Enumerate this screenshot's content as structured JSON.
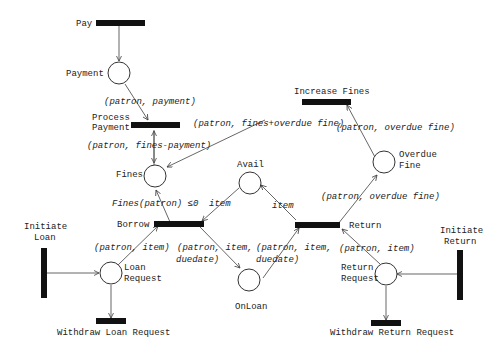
{
  "places": {
    "payment": "Payment",
    "fines": "Fines",
    "avail": "Avail",
    "overdue_fine_1": "Overdue",
    "overdue_fine_2": "Fine",
    "loan_request_1": "Loan",
    "loan_request_2": "Request",
    "onloan": "OnLoan",
    "return_request_1": "Return",
    "return_request_2": "Request"
  },
  "transitions": {
    "pay": "Pay",
    "process_payment_1": "Process",
    "process_payment_2": "Payment",
    "increase_fines": "Increase Fines",
    "borrow": "Borrow",
    "return": "Return",
    "initiate_loan_1": "Initiate",
    "initiate_loan_2": "Loan",
    "initiate_return_1": "Initiate",
    "initiate_return_2": "Return",
    "withdraw_loan": "Withdraw Loan Request",
    "withdraw_return": "Withdraw Return Request"
  },
  "arc_labels": {
    "patron_payment": "(patron, payment)",
    "patron_fines_minus_payment": "(patron, fines-payment)",
    "patron_fines_plus_overdue": "(patron, fines+overdue fine)",
    "patron_overdue_fine_top": "(patron, overdue fine)",
    "patron_overdue_fine_mid": "(patron, overdue fine)",
    "guard_fines": "Fines(patron) ≤0",
    "item_left": "item",
    "item_right": "item",
    "borrow_patron_item": "(patron, item)",
    "borrow_out_1": "(patron, item,",
    "borrow_out_2": "duedate)",
    "return_in_1": "(patron, item,",
    "return_in_2": "duedate)",
    "return_patron_item": "(patron, item)"
  }
}
